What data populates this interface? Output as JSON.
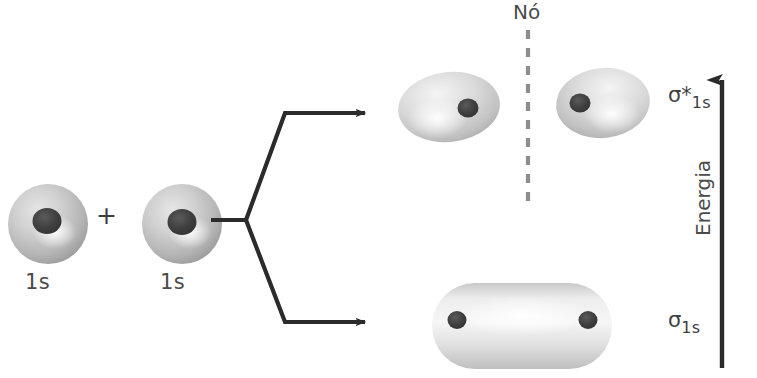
{
  "diagram": {
    "title_text": "",
    "language": "pt",
    "atomic_orbitals": [
      {
        "label": "1s",
        "cx": 48,
        "cy": 224,
        "r": 40,
        "nucleus_dx": 0,
        "nucleus_dy": -2
      },
      {
        "label": "1s",
        "cx": 182,
        "cy": 224,
        "r": 40,
        "nucleus_dx": 2,
        "nucleus_dy": -2
      }
    ],
    "plus_sign": "+",
    "node_label": "Nó",
    "energy_axis_label": "Energia",
    "molecular_orbitals": [
      {
        "name": "antibonding",
        "symbol": "σ",
        "star": "*",
        "subscript": "1s",
        "description": "two-lobe antibonding sigma orbital with nodal plane"
      },
      {
        "name": "bonding",
        "symbol": "σ",
        "star": "",
        "subscript": "1s",
        "description": "single capsule bonding sigma orbital"
      }
    ],
    "colors": {
      "ink": "#2b2b2b",
      "label_gray": "#4a4a4a",
      "orbital_light": "#efefef",
      "orbital_mid": "#bdbdbd",
      "orbital_dark": "#8e8e8e",
      "nucleus": "#4b4b4b",
      "node_dash": "#8d8d8d",
      "background": "#ffffff"
    }
  }
}
